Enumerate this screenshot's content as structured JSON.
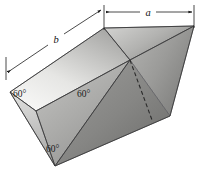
{
  "figure": {
    "type": "3d-geometric-solid",
    "background_color": "#ffffff",
    "dimensions": {
      "width_px": 202,
      "height_px": 179
    },
    "labels": {
      "dimension_a": "a",
      "dimension_b": "b",
      "angle_left": "60°",
      "angle_middle": "60°",
      "angle_bottom": "60°"
    },
    "colors": {
      "edge": "#3a3a3a",
      "hidden_edge": "#2a2a2a",
      "dimension_line": "#1d1d1d",
      "face_top_light": "#f2f2f0",
      "face_top_dark": "#9a9a98",
      "face_front_light": "#d8d8d6",
      "face_front_dark": "#8c8c8a",
      "face_right_light": "#a8a8a6",
      "face_right_dark": "#6e6e6c",
      "text": "#1a1a1a"
    },
    "faces": [
      {
        "name": "top-face",
        "shade": "light-gradient"
      },
      {
        "name": "top-right-face",
        "shade": "medium-gradient"
      },
      {
        "name": "front-left-face",
        "shade": "medium-light-gradient"
      },
      {
        "name": "front-lower-face",
        "shade": "medium-gradient"
      },
      {
        "name": "right-side-face",
        "shade": "dark-gradient"
      },
      {
        "name": "right-lower-face",
        "shade": "darkest-gradient"
      }
    ]
  }
}
